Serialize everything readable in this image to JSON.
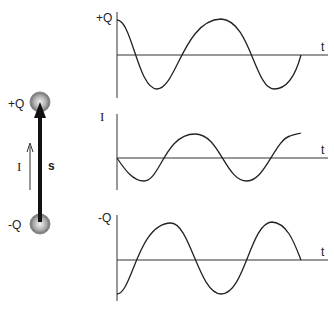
{
  "dipole": {
    "top_charge_label": "+Q",
    "bottom_charge_label": "-Q",
    "current_label": "I",
    "separation_label": "s"
  },
  "graphs": [
    {
      "y_label": "+Q",
      "x_label": "t",
      "phase": "cosine",
      "description": "charge on top sphere vs time"
    },
    {
      "y_label": "I",
      "x_label": "t",
      "phase": "negative-sine",
      "description": "current vs time"
    },
    {
      "y_label": "-Q",
      "x_label": "t",
      "phase": "negative-cosine",
      "description": "charge on bottom sphere vs time"
    }
  ],
  "colors": {
    "ink": "#222222",
    "sphere": "#9a9a9a",
    "background": "#ffffff"
  }
}
